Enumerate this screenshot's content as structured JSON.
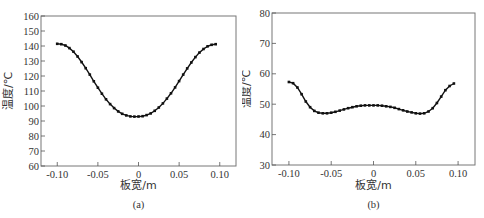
{
  "chart_data": [
    {
      "id": "a",
      "type": "line",
      "caption": "(a)",
      "title": "",
      "xlabel": "板宽/m",
      "ylabel": "温度/℃",
      "xlim": [
        -0.12,
        0.12
      ],
      "ylim": [
        60,
        160
      ],
      "xticks": [
        -0.1,
        -0.05,
        0,
        0.05,
        0.1
      ],
      "xtick_labels": [
        "-0.10",
        "-0.05",
        "0",
        "0.05",
        "0.10"
      ],
      "yticks": [
        60,
        70,
        80,
        90,
        100,
        110,
        120,
        130,
        140,
        150,
        160
      ],
      "ytick_labels": [
        "60",
        "70",
        "80",
        "90",
        "100",
        "110",
        "120",
        "130",
        "140",
        "150",
        "160"
      ],
      "grid": false,
      "legend": null,
      "series": [
        {
          "name": "temperature",
          "marker": "square",
          "x": [
            -0.1,
            -0.095,
            -0.09,
            -0.085,
            -0.08,
            -0.075,
            -0.07,
            -0.065,
            -0.06,
            -0.055,
            -0.05,
            -0.045,
            -0.04,
            -0.035,
            -0.03,
            -0.025,
            -0.02,
            -0.015,
            -0.01,
            -0.005,
            0.0,
            0.005,
            0.01,
            0.015,
            0.02,
            0.025,
            0.03,
            0.035,
            0.04,
            0.045,
            0.05,
            0.055,
            0.06,
            0.065,
            0.07,
            0.075,
            0.08,
            0.085,
            0.09,
            0.095
          ],
          "y": [
            141.5,
            141.2,
            140.3,
            138.6,
            136.2,
            133.0,
            129.3,
            125.2,
            120.9,
            116.5,
            112.2,
            108.2,
            104.5,
            101.3,
            98.6,
            96.4,
            94.8,
            93.7,
            93.1,
            92.9,
            93.0,
            93.2,
            93.9,
            95.1,
            96.8,
            99.0,
            101.7,
            104.9,
            108.5,
            112.4,
            116.6,
            120.9,
            125.1,
            129.0,
            132.6,
            135.6,
            138.0,
            139.8,
            140.8,
            141.2
          ]
        }
      ]
    },
    {
      "id": "b",
      "type": "line",
      "caption": "(b)",
      "title": "",
      "xlabel": "板宽/m",
      "ylabel": "温度/℃",
      "xlim": [
        -0.12,
        0.12
      ],
      "ylim": [
        30,
        80
      ],
      "xticks": [
        -0.1,
        -0.05,
        0,
        0.05,
        0.1
      ],
      "xtick_labels": [
        "-0.10",
        "-0.05",
        "0",
        "0.05",
        "0.10"
      ],
      "yticks": [
        30,
        40,
        50,
        60,
        70,
        80
      ],
      "ytick_labels": [
        "30",
        "40",
        "50",
        "60",
        "70",
        "80"
      ],
      "grid": false,
      "legend": null,
      "series": [
        {
          "name": "temperature",
          "marker": "square",
          "x": [
            -0.1,
            -0.095,
            -0.09,
            -0.085,
            -0.08,
            -0.075,
            -0.07,
            -0.065,
            -0.06,
            -0.055,
            -0.05,
            -0.045,
            -0.04,
            -0.035,
            -0.03,
            -0.025,
            -0.02,
            -0.015,
            -0.01,
            -0.005,
            0.0,
            0.005,
            0.01,
            0.015,
            0.02,
            0.025,
            0.03,
            0.035,
            0.04,
            0.045,
            0.05,
            0.055,
            0.06,
            0.065,
            0.07,
            0.075,
            0.08,
            0.085,
            0.09,
            0.095
          ],
          "y": [
            57.3,
            56.9,
            55.5,
            53.3,
            50.9,
            49.0,
            47.8,
            47.2,
            47.0,
            47.0,
            47.2,
            47.5,
            47.9,
            48.3,
            48.7,
            49.0,
            49.3,
            49.5,
            49.6,
            49.6,
            49.6,
            49.6,
            49.5,
            49.3,
            49.1,
            48.8,
            48.4,
            48.0,
            47.6,
            47.3,
            47.0,
            46.9,
            47.0,
            47.6,
            48.7,
            50.4,
            52.5,
            54.6,
            56.0,
            56.8
          ]
        }
      ]
    }
  ]
}
